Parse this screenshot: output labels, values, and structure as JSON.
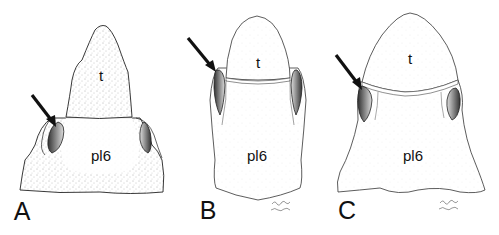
{
  "figure": {
    "panels": [
      {
        "id": "A",
        "panel_label": "A",
        "upper_part_label": "t",
        "lower_part_label": "pl6",
        "has_arrow": true,
        "has_signature": false,
        "shading": "stippled"
      },
      {
        "id": "B",
        "panel_label": "B",
        "upper_part_label": "t",
        "lower_part_label": "pl6",
        "has_arrow": true,
        "has_signature": true,
        "shading": "light"
      },
      {
        "id": "C",
        "panel_label": "C",
        "upper_part_label": "t",
        "lower_part_label": "pl6",
        "has_arrow": true,
        "has_signature": true,
        "shading": "light"
      }
    ],
    "colors": {
      "background": "#ffffff",
      "ink": "#111111",
      "cavity": "#555555"
    }
  }
}
